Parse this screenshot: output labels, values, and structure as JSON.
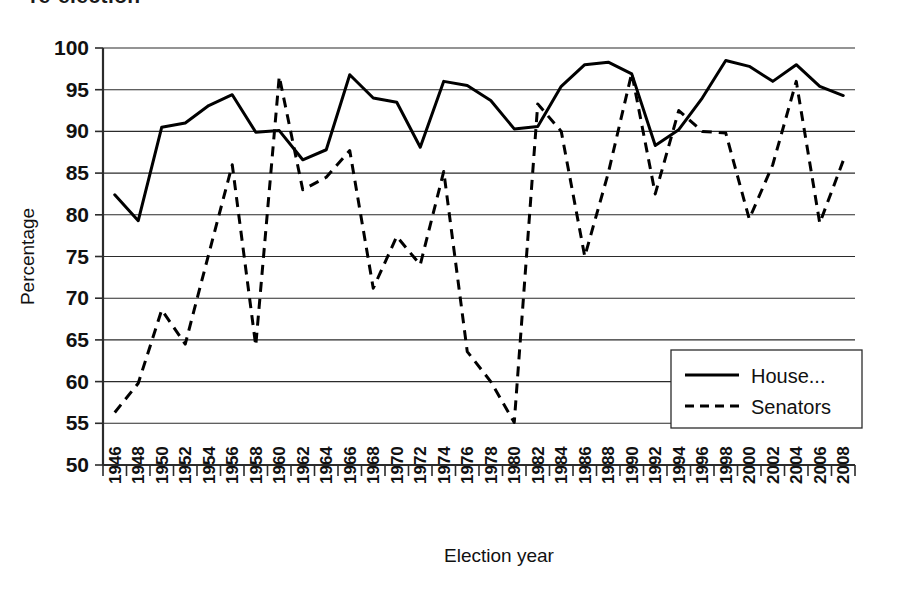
{
  "figure": {
    "clipped_title": "re-election",
    "width": 904,
    "height": 592
  },
  "chart_data": {
    "type": "line",
    "title": "",
    "xlabel": "Election year",
    "ylabel": "Percentage",
    "ylim": [
      50,
      100
    ],
    "ytick_step": 5,
    "yticks": [
      50,
      55,
      60,
      65,
      70,
      75,
      80,
      85,
      90,
      95,
      100
    ],
    "grid": true,
    "legend_position": "inside-lower-right",
    "categories": [
      "1946",
      "1948",
      "1950",
      "1952",
      "1954",
      "1956",
      "1958",
      "1960",
      "1962",
      "1964",
      "1966",
      "1968",
      "1970",
      "1972",
      "1974",
      "1976",
      "1978",
      "1980",
      "1982",
      "1984",
      "1986",
      "1988",
      "1990",
      "1992",
      "1994",
      "1996",
      "1998",
      "2000",
      "2002",
      "2004",
      "2006",
      "2008"
    ],
    "series": [
      {
        "name": "House...",
        "style": "solid",
        "color": "#000000",
        "values": [
          82.4,
          79.3,
          90.5,
          91.0,
          93.1,
          94.4,
          89.9,
          90.1,
          86.6,
          87.8,
          96.8,
          94.0,
          93.5,
          88.1,
          96.0,
          95.5,
          93.7,
          90.3,
          90.6,
          95.4,
          98.0,
          98.3,
          96.9,
          88.3,
          90.2,
          94.0,
          98.5,
          97.8,
          96.0,
          98.0,
          95.4,
          94.3
        ]
      },
      {
        "name": "Senators",
        "style": "dashed",
        "color": "#000000",
        "values": [
          56.3,
          59.8,
          68.6,
          64.5,
          75.3,
          86.0,
          64.3,
          96.6,
          83.0,
          84.5,
          87.7,
          71.2,
          77.4,
          74.0,
          85.2,
          63.6,
          60.0,
          55.1,
          93.3,
          90.0,
          75.0,
          85.0,
          97.0,
          82.5,
          92.5,
          90.0,
          89.8,
          79.5,
          86.0,
          96.0,
          79.0,
          86.5
        ]
      }
    ]
  },
  "axes": {
    "y_axis_label": "Percentage",
    "x_axis_label": "Election year"
  },
  "legend": {
    "entries": [
      {
        "label": "House...",
        "style": "solid"
      },
      {
        "label": "Senators",
        "style": "dashed"
      }
    ]
  },
  "colors": {
    "line": "#000000",
    "grid": "#2b2b2b",
    "background": "#ffffff"
  }
}
